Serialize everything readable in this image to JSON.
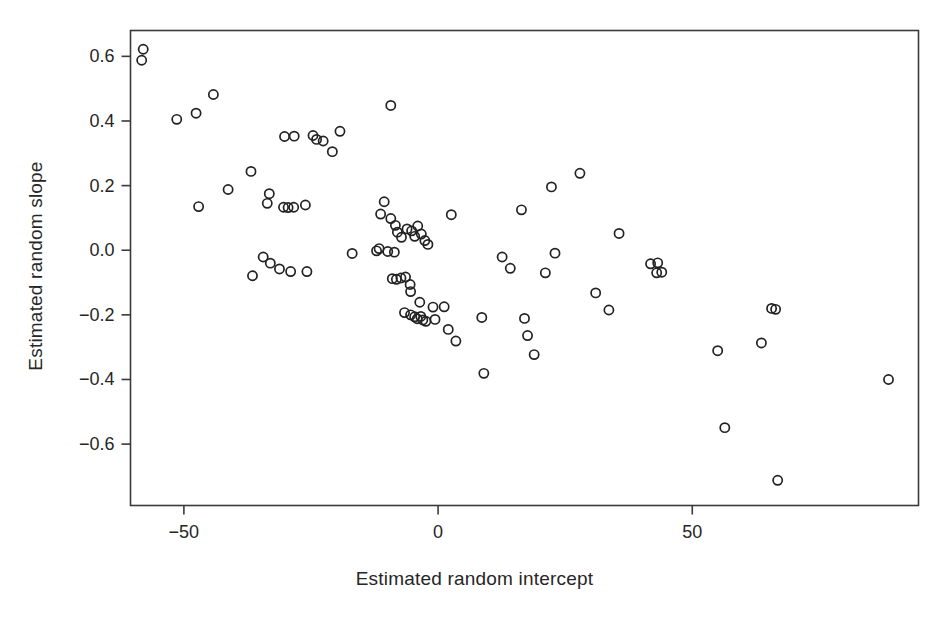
{
  "chart_data": {
    "type": "scatter",
    "title": "",
    "xlabel": "Estimated random intercept",
    "ylabel": "Estimated random slope",
    "xticks": [
      -50,
      0,
      50
    ],
    "xtick_labels": [
      "−50",
      "0",
      "50"
    ],
    "yticks": [
      0.6,
      0.4,
      0.2,
      0.0,
      -0.2,
      -0.4,
      -0.6
    ],
    "ytick_labels": [
      "0.6",
      "0.4",
      "0.2",
      "0.0",
      "−0.2",
      "−0.4",
      "−0.6"
    ],
    "xlim": [
      -60.5,
      94.5
    ],
    "ylim": [
      -0.79,
      0.68
    ],
    "grid": false,
    "legend": null,
    "marker": "open-circle",
    "marker_color": "#222222",
    "background_color": "#ffffff",
    "frame_color": "#3a3a3a",
    "n_points": 97,
    "points": [
      [
        -58.0,
        0.622
      ],
      [
        -58.3,
        0.588
      ],
      [
        -51.4,
        0.405
      ],
      [
        -47.6,
        0.424
      ],
      [
        -44.2,
        0.482
      ],
      [
        -47.1,
        0.135
      ],
      [
        -41.3,
        0.188
      ],
      [
        -36.8,
        0.244
      ],
      [
        -33.2,
        0.175
      ],
      [
        -33.6,
        0.145
      ],
      [
        -30.2,
        0.352
      ],
      [
        -28.3,
        0.353
      ],
      [
        -30.4,
        0.133
      ],
      [
        -29.5,
        0.132
      ],
      [
        -28.4,
        0.133
      ],
      [
        -26.1,
        0.14
      ],
      [
        -24.6,
        0.355
      ],
      [
        -23.9,
        0.343
      ],
      [
        -22.6,
        0.338
      ],
      [
        -19.3,
        0.368
      ],
      [
        -20.8,
        0.305
      ],
      [
        -34.4,
        -0.021
      ],
      [
        -33.0,
        -0.04
      ],
      [
        -31.2,
        -0.058
      ],
      [
        -29.0,
        -0.066
      ],
      [
        -25.8,
        -0.066
      ],
      [
        -36.5,
        -0.079
      ],
      [
        -16.9,
        -0.01
      ],
      [
        -11.3,
        0.112
      ],
      [
        -9.3,
        0.448
      ],
      [
        -10.6,
        0.15
      ],
      [
        -9.3,
        0.098
      ],
      [
        -8.4,
        0.077
      ],
      [
        -8.0,
        0.056
      ],
      [
        -7.2,
        0.04
      ],
      [
        -6.1,
        0.066
      ],
      [
        -5.2,
        0.06
      ],
      [
        -4.6,
        0.043
      ],
      [
        -4.0,
        0.075
      ],
      [
        -3.3,
        0.05
      ],
      [
        -2.6,
        0.03
      ],
      [
        -2.0,
        0.018
      ],
      [
        -11.6,
        0.005
      ],
      [
        -12.1,
        -0.002
      ],
      [
        -9.9,
        -0.004
      ],
      [
        -8.6,
        -0.006
      ],
      [
        -9.0,
        -0.088
      ],
      [
        -8.2,
        -0.09
      ],
      [
        -7.3,
        -0.086
      ],
      [
        -6.4,
        -0.083
      ],
      [
        -5.5,
        -0.106
      ],
      [
        -5.4,
        -0.128
      ],
      [
        -6.6,
        -0.193
      ],
      [
        -5.4,
        -0.2
      ],
      [
        -4.6,
        -0.206
      ],
      [
        -4.1,
        -0.212
      ],
      [
        -3.4,
        -0.205
      ],
      [
        -3.0,
        -0.216
      ],
      [
        -2.4,
        -0.22
      ],
      [
        -3.6,
        -0.161
      ],
      [
        -1.0,
        -0.176
      ],
      [
        -0.6,
        -0.214
      ],
      [
        1.2,
        -0.175
      ],
      [
        2.6,
        0.11
      ],
      [
        2.0,
        -0.245
      ],
      [
        3.5,
        -0.281
      ],
      [
        8.6,
        -0.208
      ],
      [
        9.0,
        -0.381
      ],
      [
        12.6,
        -0.021
      ],
      [
        14.2,
        -0.056
      ],
      [
        16.4,
        0.125
      ],
      [
        17.6,
        -0.264
      ],
      [
        17.0,
        -0.211
      ],
      [
        18.9,
        -0.323
      ],
      [
        21.1,
        -0.07
      ],
      [
        23.0,
        -0.009
      ],
      [
        22.3,
        0.196
      ],
      [
        27.9,
        0.238
      ],
      [
        31.0,
        -0.132
      ],
      [
        33.6,
        -0.185
      ],
      [
        35.6,
        0.052
      ],
      [
        41.8,
        -0.042
      ],
      [
        43.2,
        -0.039
      ],
      [
        43.0,
        -0.07
      ],
      [
        44.0,
        -0.068
      ],
      [
        55.0,
        -0.311
      ],
      [
        56.4,
        -0.549
      ],
      [
        63.6,
        -0.287
      ],
      [
        65.6,
        -0.18
      ],
      [
        66.4,
        -0.183
      ],
      [
        66.8,
        -0.712
      ],
      [
        88.6,
        -0.4
      ]
    ]
  }
}
